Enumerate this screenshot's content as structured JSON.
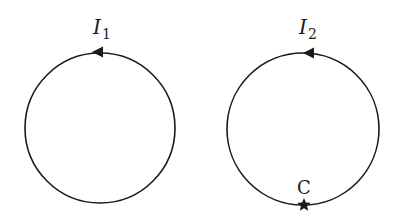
{
  "diagram": {
    "colors": {
      "stroke": "#1a1a1a",
      "background": "#ffffff"
    },
    "loops": [
      {
        "id": "loop-1",
        "center": [
          100,
          128
        ],
        "radius": 75,
        "current_label": "I",
        "current_subscript": "1",
        "arrow_direction": "counterclockwise",
        "arrow_position": "top"
      },
      {
        "id": "loop-2",
        "center": [
          303,
          129
        ],
        "radius": 76,
        "current_label": "I",
        "current_subscript": "2",
        "arrow_direction": "counterclockwise",
        "arrow_position": "top",
        "point_label": "C",
        "point_marker": "star",
        "point_position": "bottom"
      }
    ]
  }
}
